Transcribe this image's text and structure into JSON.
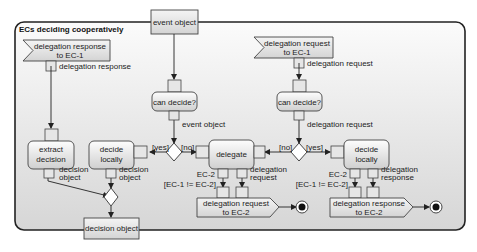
{
  "diagram": {
    "type": "UML activity diagram",
    "partition_title": "ECs deciding cooperatively",
    "input_objects": {
      "event_object": "event object"
    },
    "accept_signals": [
      {
        "id": "recv-response",
        "line1": "delegation response",
        "line2": "to EC-1",
        "out_pin_label": "delegation response"
      },
      {
        "id": "recv-request",
        "line1": "delegation request",
        "line2": "to EC-1",
        "out_pin_label": "delegation request"
      }
    ],
    "actions": [
      {
        "id": "extract-decision",
        "line1": "extract",
        "line2": "decision",
        "out_pin_line1": "decision",
        "out_pin_line2": "object"
      },
      {
        "id": "decide-locally-1",
        "line1": "decide",
        "line2": "locally",
        "out_pin_line1": "decision",
        "out_pin_line2": "object"
      },
      {
        "id": "can-decide-1",
        "label": "can decide?",
        "out_pin_label": "event object"
      },
      {
        "id": "delegate",
        "label": "delegate",
        "out_pin_ec": "EC-2",
        "out_pin_req_line1": "delegation",
        "out_pin_req_line2": "request",
        "guard": "[EC-1 != EC-2]"
      },
      {
        "id": "can-decide-2",
        "label": "can decide?",
        "out_pin_label": "delegation request"
      },
      {
        "id": "decide-locally-2",
        "line1": "decide",
        "line2": "locally",
        "out_pin_ec": "EC-2",
        "out_pin_resp_line1": "delegation",
        "out_pin_resp_line2": "response",
        "guard": "[EC-1 != EC-2]"
      }
    ],
    "send_signals": [
      {
        "id": "send-request",
        "line1": "delegation request",
        "line2": "to EC-2"
      },
      {
        "id": "send-response",
        "line1": "delegation response",
        "line2": "to EC-2"
      }
    ],
    "decisions": [
      {
        "id": "decision-1",
        "left_guard": "[yes]",
        "right_guard": "[no]"
      },
      {
        "id": "decision-2",
        "left_guard": "[no]",
        "right_guard": "[yes]"
      }
    ],
    "output_objects": {
      "decision_object": "decision object"
    },
    "colors": {
      "background": "#ffffff",
      "partition_fill": "#e4e4e4",
      "node_fill_top": "#fafafa",
      "node_fill_bottom": "#d2d2d2",
      "stroke": "#333333"
    }
  }
}
